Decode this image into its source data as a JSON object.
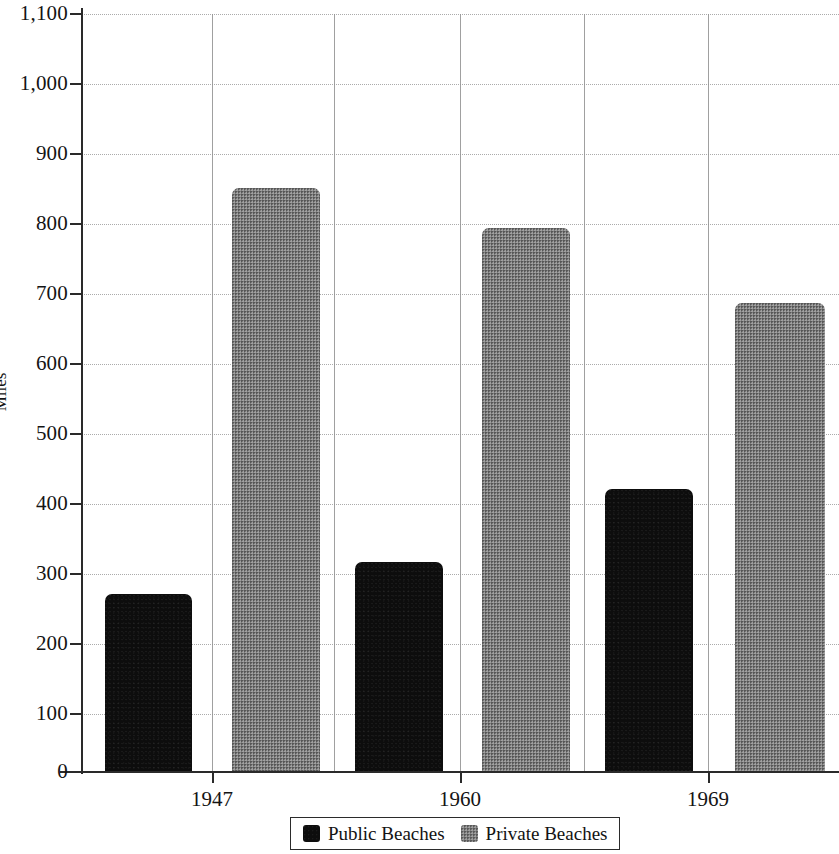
{
  "chart_data": {
    "type": "bar",
    "title": "",
    "xlabel": "",
    "ylabel": "Miles",
    "categories": [
      "1947",
      "1960",
      "1969"
    ],
    "series": [
      {
        "name": "Public Beaches",
        "color": "#0d0d0d",
        "values": [
          258,
          305,
          410
        ]
      },
      {
        "name": "Private Beaches",
        "color": "#7d7d7d",
        "values": [
          848,
          790,
          680
        ]
      }
    ],
    "ylim": [
      0,
      1100
    ],
    "ytick_values": [
      0,
      100,
      200,
      300,
      400,
      500,
      600,
      700,
      800,
      900,
      1000,
      1100
    ],
    "ytick_labels": [
      "0",
      "100",
      "200",
      "300",
      "400",
      "500",
      "600",
      "700",
      "800",
      "900",
      "1,000",
      "1,100"
    ],
    "grid": "both",
    "legend_position": "bottom-center"
  },
  "axis": {
    "y_title": "Miles",
    "y_ticks": [
      {
        "label": "1,100",
        "value": 1100
      },
      {
        "label": "1,000",
        "value": 1000
      },
      {
        "label": "900",
        "value": 900
      },
      {
        "label": "800",
        "value": 800
      },
      {
        "label": "700",
        "value": 700
      },
      {
        "label": "600",
        "value": 600
      },
      {
        "label": "500",
        "value": 500
      },
      {
        "label": "400",
        "value": 400
      },
      {
        "label": "300",
        "value": 300
      },
      {
        "label": "200",
        "value": 200
      },
      {
        "label": "100",
        "value": 100
      },
      {
        "label": "0",
        "value": 0
      }
    ],
    "x_ticks": [
      {
        "label": "1947"
      },
      {
        "label": "1960"
      },
      {
        "label": "1969"
      }
    ]
  },
  "legend": {
    "items": [
      {
        "label": "Public Beaches",
        "color": "#0d0d0d"
      },
      {
        "label": "Private Beaches",
        "color": "#7d7d7d"
      }
    ]
  }
}
